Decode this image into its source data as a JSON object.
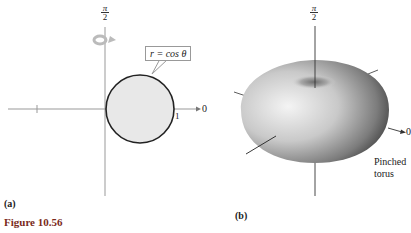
{
  "figure": {
    "caption": "Figure 10.56",
    "panels": [
      {
        "id": "a",
        "label": "(a)",
        "axis_top_label_num": "π",
        "axis_top_label_den": "2",
        "axis_right_label": "0",
        "tick_label": "1",
        "equation_callout": "r = cos θ",
        "rotation_icon": "rotate-around-axis-icon",
        "fill_color": "#e8e8e8",
        "curve_color": "#222222"
      },
      {
        "id": "b",
        "label": "(b)",
        "axis_top_label_num": "π",
        "axis_top_label_den": "2",
        "axis_right_label": "0",
        "surface_label_line1": "Pinched",
        "surface_label_line2": "torus"
      }
    ]
  }
}
